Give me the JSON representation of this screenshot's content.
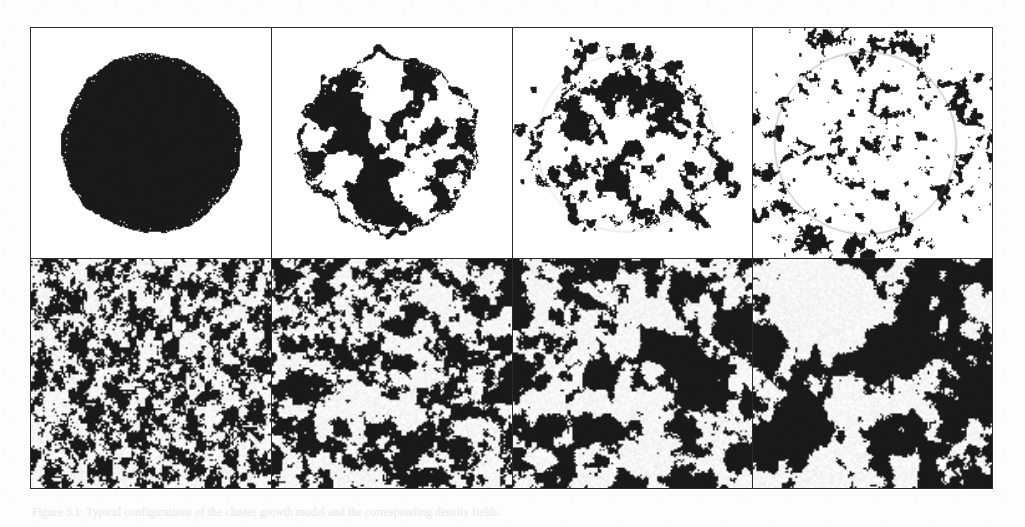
{
  "figure": {
    "caption": "Figure 3.1: Typical configurations of the cluster growth model and the corresponding density fields.",
    "frame_color": "#2b2b2b",
    "background_color": "#ffffff",
    "ink_color": "#1a1a1a",
    "guide_circle_color": "#9a9a9a",
    "rows": 2,
    "columns": 4
  },
  "chart_data": {
    "type": "heatmap",
    "title": "",
    "xlabel": "",
    "ylabel": "",
    "grid": false,
    "legend": "none",
    "layout": {
      "rows": 2,
      "columns": 4,
      "row_labels": [
        "cluster-shape row",
        "density-field row"
      ]
    },
    "panels": [
      {
        "index": 0,
        "row": 0,
        "column": 0,
        "kind": "cluster-disk",
        "seed": 11,
        "fill_fraction": 0.985,
        "radius_fraction": 0.385,
        "edge_roughness": 0.035,
        "noise_scale": 0.018,
        "fragmentation": 0.0,
        "show_guide_circle": false,
        "center": [
          0.5,
          0.5
        ]
      },
      {
        "index": 1,
        "row": 0,
        "column": 1,
        "kind": "cluster-disk",
        "seed": 23,
        "fill_fraction": 0.955,
        "radius_fraction": 0.375,
        "edge_roughness": 0.105,
        "noise_scale": 0.035,
        "fragmentation": 0.06,
        "show_guide_circle": false,
        "center": [
          0.48,
          0.5
        ]
      },
      {
        "index": 2,
        "row": 0,
        "column": 2,
        "kind": "cluster-disk",
        "seed": 37,
        "fill_fraction": 0.88,
        "radius_fraction": 0.375,
        "edge_roughness": 0.2,
        "noise_scale": 0.062,
        "fragmentation": 0.17,
        "show_guide_circle": true,
        "guide_circle_opacity": 0.16,
        "center": [
          0.47,
          0.5
        ]
      },
      {
        "index": 3,
        "row": 0,
        "column": 3,
        "kind": "cluster-disk",
        "seed": 59,
        "fill_fraction": 0.7,
        "radius_fraction": 0.385,
        "edge_roughness": 0.34,
        "noise_scale": 0.105,
        "fragmentation": 0.38,
        "show_guide_circle": true,
        "guide_circle_opacity": 0.42,
        "center": [
          0.47,
          0.5
        ]
      },
      {
        "index": 4,
        "row": 1,
        "column": 0,
        "kind": "density-field",
        "seed": 71,
        "correlation_length": 1.6,
        "black_fraction": 0.5,
        "contrast": 0.55
      },
      {
        "index": 5,
        "row": 1,
        "column": 1,
        "kind": "density-field",
        "seed": 83,
        "correlation_length": 3.2,
        "black_fraction": 0.5,
        "contrast": 0.8
      },
      {
        "index": 6,
        "row": 1,
        "column": 2,
        "kind": "density-field",
        "seed": 97,
        "correlation_length": 5.4,
        "black_fraction": 0.48,
        "contrast": 0.95
      },
      {
        "index": 7,
        "row": 1,
        "column": 3,
        "kind": "density-field",
        "seed": 109,
        "correlation_length": 8.6,
        "black_fraction": 0.46,
        "contrast": 1.0,
        "void_center": [
          0.3,
          0.22
        ],
        "void_radius": 0.2
      }
    ]
  }
}
